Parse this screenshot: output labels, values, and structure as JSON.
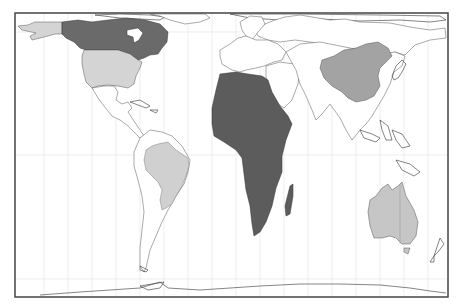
{
  "map": {
    "type": "world-choropleth",
    "projection": "equal-area cylindrical",
    "frame": {
      "x": 15,
      "y": 13,
      "width": 433,
      "height": 284,
      "stroke": "#444444"
    },
    "background": "#ffffff",
    "graticule": {
      "color": "#e2e2e2",
      "meridians_x": [
        44,
        68,
        92,
        116,
        140,
        164,
        188,
        212,
        236,
        260,
        284,
        308,
        332,
        356,
        380,
        404,
        428
      ],
      "parallels_y": [
        32,
        155,
        279
      ]
    },
    "highlighted_regions": [
      {
        "name": "Canada",
        "fill": "#6a6a6a"
      },
      {
        "name": "United States",
        "fill": "#d4d4d4"
      },
      {
        "name": "Brazil",
        "fill": "#d0d0d0"
      },
      {
        "name": "Africa",
        "fill": "#5c5c5c"
      },
      {
        "name": "China",
        "fill": "#a3a3a3"
      },
      {
        "name": "Australia",
        "fill": "#c6c6c6"
      }
    ],
    "unhighlighted_fill": "#ffffff",
    "coastline_color": "#333333"
  }
}
